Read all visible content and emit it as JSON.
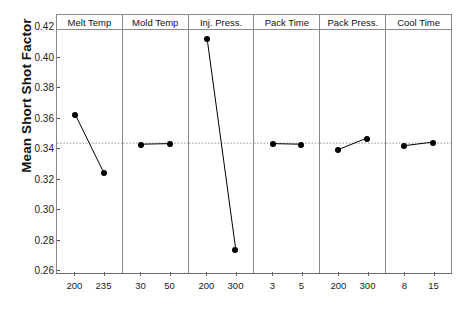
{
  "chart_data": {
    "type": "line",
    "title": "",
    "subtitle": "",
    "xlabel": "",
    "ylabel": "Mean Short Shot Factor",
    "ylim": [
      0.26,
      0.42
    ],
    "ytick_labels": [
      "0.26",
      "0.28",
      "0.30",
      "0.32",
      "0.34",
      "0.36",
      "0.38",
      "0.40",
      "0.42"
    ],
    "ytick_values": [
      0.26,
      0.28,
      0.3,
      0.32,
      0.34,
      0.36,
      0.38,
      0.4,
      0.42
    ],
    "grid": false,
    "legend": "none",
    "reference_line": 0.3455,
    "reference_line_style": "dotted",
    "marker": "filled-circle",
    "panels": [
      {
        "name": "Melt Temp",
        "categories": [
          "200",
          "235"
        ],
        "values": [
          0.3645,
          0.3262
        ]
      },
      {
        "name": "Mold Temp",
        "categories": [
          "30",
          "50"
        ],
        "values": [
          0.3448,
          0.3452
        ]
      },
      {
        "name": "Inj. Press.",
        "categories": [
          "200",
          "300"
        ],
        "values": [
          0.4142,
          0.2758
        ]
      },
      {
        "name": "Pack Time",
        "categories": [
          "3",
          "5"
        ],
        "values": [
          0.3452,
          0.3448
        ]
      },
      {
        "name": "Pack Press.",
        "categories": [
          "200",
          "300"
        ],
        "values": [
          0.3412,
          0.3488
        ]
      },
      {
        "name": "Cool Time",
        "categories": [
          "8",
          "15"
        ],
        "values": [
          0.3438,
          0.3462
        ]
      }
    ]
  },
  "colors": {
    "series": "#000000",
    "axis": "#6a6a6a",
    "panel_border": "#8a8a8a",
    "reference_line": "#8f8f8f",
    "background": "#ffffff"
  }
}
